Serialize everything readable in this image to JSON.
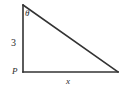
{
  "figure": {
    "type": "right-triangle-diagram",
    "background_color": "#ffffff",
    "stroke_color": "#333333",
    "labels": {
      "angle_theta": "θ",
      "vertical_leg": "3",
      "horizontal_leg": "x",
      "vertex_point": "P"
    },
    "geometry": {
      "top_vertex": [
        23,
        5
      ],
      "bottom_left_vertex": [
        23,
        72
      ],
      "bottom_right_vertex": [
        118,
        72
      ],
      "vertical_leg_length_label": "3",
      "horizontal_leg_length_label": "x",
      "angle_location": "top_vertex",
      "right_angle_location": "bottom_left_vertex"
    }
  }
}
